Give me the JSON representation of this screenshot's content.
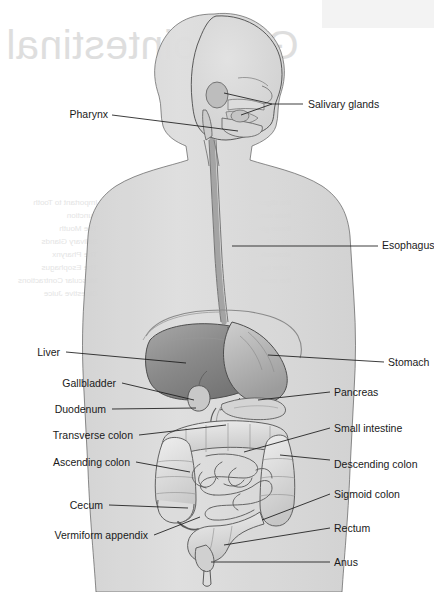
{
  "page": {
    "background_color": "#ffffff",
    "body_fill": "#dcdcdc",
    "outline_color": "#3a3a3a",
    "label_color": "#1a1a1a",
    "organ_fill_light": "#e8e8e8",
    "organ_fill_mid": "#c9c9c9",
    "liver_fill": "#8f8f8f",
    "stomach_fill": "#b4b4b4"
  },
  "bleed_through": {
    "title": "Gastrointestinal",
    "note": "mirrored show-through text from reverse of page",
    "left_column": "Important to Tooth\nFunction\nThe Mouth\nSalivary Glands\nThe Pharynx\nThe Esophagus\nMuscular Contractions\nDigestive Juice",
    "right_column": "the digestive tract\nfrom mouth to anus\nthese glands pour\nsecretions into the\nstomach is the\nouter layer of the\nthe small intestine"
  },
  "labels": {
    "left": [
      {
        "text": "Pharynx",
        "x": 108,
        "y": 118,
        "tip_x": 238,
        "tip_y": 131
      },
      {
        "text": "Liver",
        "x": 60,
        "y": 356,
        "tip_x": 186,
        "tip_y": 363
      },
      {
        "text": "Gallbladder",
        "x": 116,
        "y": 387,
        "tip_x": 194,
        "tip_y": 400
      },
      {
        "text": "Duodenum",
        "x": 106,
        "y": 413,
        "tip_x": 196,
        "tip_y": 408
      },
      {
        "text": "Transverse colon",
        "x": 133,
        "y": 439,
        "tip_x": 226,
        "tip_y": 425
      },
      {
        "text": "Ascending colon",
        "x": 130,
        "y": 466,
        "tip_x": 190,
        "tip_y": 472
      },
      {
        "text": "Cecum",
        "x": 103,
        "y": 509,
        "tip_x": 188,
        "tip_y": 508
      },
      {
        "text": "Vermiform appendix",
        "x": 148,
        "y": 539,
        "tip_x": 200,
        "tip_y": 516
      }
    ],
    "right": [
      {
        "text": "Salivary glands",
        "x": 308,
        "y": 108,
        "tip_x": 262,
        "tip_y": 104
      },
      {
        "text": "Esophagus",
        "x": 382,
        "y": 249,
        "tip_x": 232,
        "tip_y": 246
      },
      {
        "text": "Stomach",
        "x": 388,
        "y": 366,
        "tip_x": 268,
        "tip_y": 355
      },
      {
        "text": "Pancreas",
        "x": 334,
        "y": 396,
        "tip_x": 258,
        "tip_y": 400
      },
      {
        "text": "Small intestine",
        "x": 334,
        "y": 432,
        "tip_x": 244,
        "tip_y": 452
      },
      {
        "text": "Descending colon",
        "x": 334,
        "y": 464,
        "tip_x": 280,
        "tip_y": 455
      },
      {
        "text": "Sigmoid colon",
        "x": 334,
        "y": 498,
        "tip_x": 262,
        "tip_y": 520
      },
      {
        "text": "Rectum",
        "x": 334,
        "y": 532,
        "tip_x": 224,
        "tip_y": 545
      },
      {
        "text": "Anus",
        "x": 334,
        "y": 566,
        "tip_x": 211,
        "tip_y": 562
      }
    ]
  }
}
